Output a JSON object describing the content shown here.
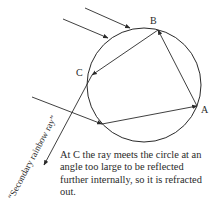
{
  "diagram": {
    "type": "ray-optics",
    "points": {
      "A": {
        "label": "A"
      },
      "B": {
        "label": "B"
      },
      "C": {
        "label": "C"
      }
    },
    "rotated_label": "“Secondary rainbow ray”",
    "caption": "At C the ray meets the circle at an angle too large to be reflected further internally, so it is refracted out.",
    "colors": {
      "stroke": "#2a2a2a",
      "text": "#2a2a2a",
      "background": "#ffffff"
    }
  }
}
